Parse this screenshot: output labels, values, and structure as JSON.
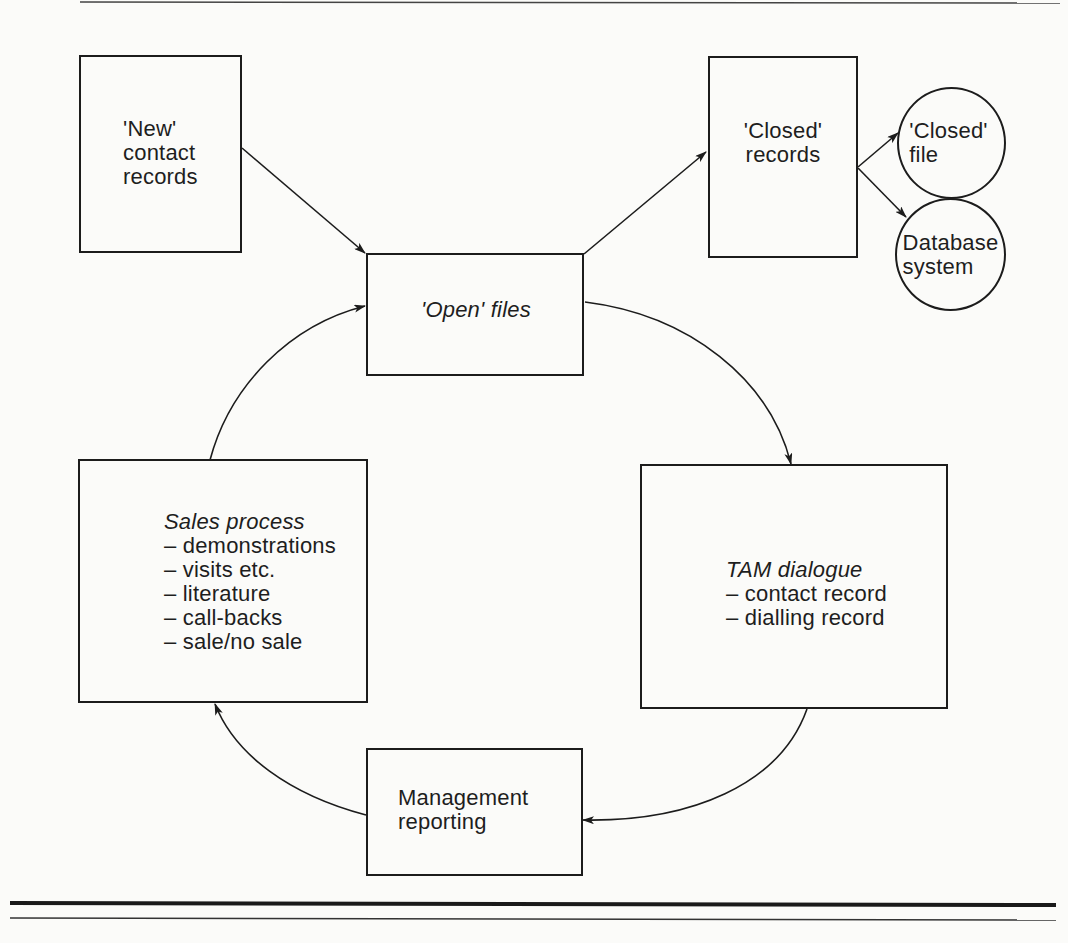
{
  "nodes": {
    "new_contact": {
      "lines": [
        "'New'",
        "contact",
        "records"
      ]
    },
    "closed_records": {
      "lines": [
        "'Closed'",
        "records"
      ]
    },
    "closed_file": {
      "lines": [
        "'Closed'",
        "file"
      ]
    },
    "database_system": {
      "lines": [
        "Database",
        "system"
      ]
    },
    "open_files": {
      "label": "'Open' files"
    },
    "sales_process": {
      "title": "Sales process",
      "items": [
        "– demonstrations",
        "– visits etc.",
        "– literature",
        "– call-backs",
        "– sale/no sale"
      ]
    },
    "tam_dialogue": {
      "title": "TAM dialogue",
      "items": [
        "– contact record",
        "– dialling record"
      ]
    },
    "management_reporting": {
      "lines": [
        "Management",
        "reporting"
      ]
    }
  },
  "edges": [
    {
      "from": "new_contact",
      "to": "open_files"
    },
    {
      "from": "open_files",
      "to": "closed_records"
    },
    {
      "from": "closed_records",
      "to": "closed_file"
    },
    {
      "from": "closed_records",
      "to": "database_system"
    },
    {
      "from": "open_files",
      "to": "tam_dialogue"
    },
    {
      "from": "tam_dialogue",
      "to": "management_reporting"
    },
    {
      "from": "management_reporting",
      "to": "sales_process"
    },
    {
      "from": "sales_process",
      "to": "open_files"
    }
  ],
  "colors": {
    "ink": "#1c1c1c",
    "paper": "#fbfbf9"
  }
}
